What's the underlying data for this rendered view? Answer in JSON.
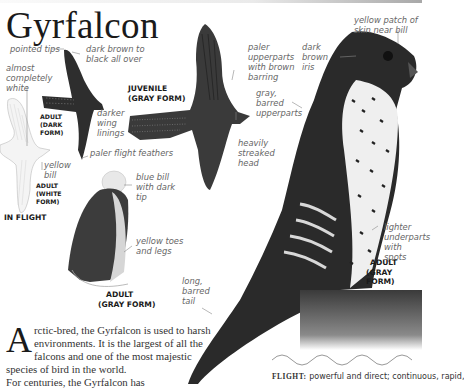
{
  "page": {
    "title": "Gyrfalcon",
    "accent_color": "#1a1a1a",
    "label_color": "#666666"
  },
  "labels": {
    "pointed_tips": "pointed tips",
    "dark_brown_black": "dark brown to black all over",
    "almost_white": "almost completely white",
    "darker_wing_linings": "darker wing linings",
    "paler_flight_feathers": "paler flight feathers",
    "yellow_bill": "yellow bill",
    "paler_upperparts": "paler upperparts with brown barring",
    "heavily_streaked_head": "heavily streaked head",
    "gray_barred_upperparts": "gray, barred upperparts",
    "dark_brown_iris": "dark brown iris",
    "yellow_patch": "yellow patch of skin near bill",
    "blue_bill": "blue bill with dark tip",
    "yellow_toes": "yellow toes and legs",
    "lighter_underparts": "lighter underparts with spots",
    "long_barred_tail": "long, barred tail"
  },
  "captions": {
    "juvenile_gray": [
      "JUVENILE",
      "(GRAY FORM)"
    ],
    "adult_dark": [
      "ADULT",
      "(DARK",
      "FORM)"
    ],
    "adult_white": [
      "ADULT",
      "(WHITE",
      "FORM)"
    ],
    "in_flight": "IN FLIGHT",
    "adult_gray_small": [
      "ADULT",
      "(GRAY FORM)"
    ],
    "adult_gray_large": [
      "ADULT",
      "(GRAY FORM)"
    ]
  },
  "body": {
    "dropcap": "A",
    "paragraph1": "rctic-bred, the Gyrfalcon is used to harsh environments. It is the largest of all the falcons and one of the most majestic species of bird in the world.",
    "paragraph2": "For centuries, the Gyrfalcon has"
  },
  "flight": {
    "label": "FLIGHT:",
    "text": "powerful and direct; continuous, rapid,"
  }
}
